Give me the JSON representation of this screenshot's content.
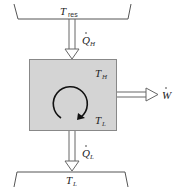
{
  "diagram": {
    "type": "heat-engine",
    "hot_reservoir": {
      "symbol": "T",
      "subscript": "res"
    },
    "heat_in": {
      "symbol": "Q",
      "subscript": "H",
      "dot": true
    },
    "engine": {
      "hot_label": {
        "symbol": "T",
        "subscript": "H"
      },
      "cold_label": {
        "symbol": "T",
        "subscript": "L"
      },
      "fill_color": "#d4d4d4",
      "border_color": "#888888"
    },
    "work_out": {
      "symbol": "W",
      "dot": true
    },
    "heat_out": {
      "symbol": "Q",
      "subscript": "L",
      "dot": true
    },
    "cold_reservoir": {
      "symbol": "T",
      "subscript": "L"
    }
  }
}
